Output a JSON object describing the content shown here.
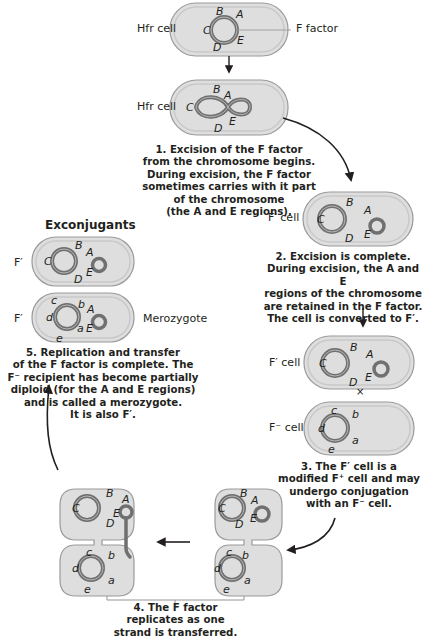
{
  "colors": {
    "cell_fill": "#dedede",
    "cell_membrane": "#c9c9c9",
    "cell_outline": "#9a9a9a",
    "chromosome": "#707070",
    "chromosome_inner": "#b5b5b5",
    "arrow": "#231f20",
    "text": "#231f20"
  },
  "labels": {
    "hfr_cell_1": "Hfr cell",
    "f_factor": "F factor",
    "hfr_cell_2": "Hfr cell",
    "f_prime_cell_2": "F′ cell",
    "f_prime_cell_3": "F′ cell",
    "cross": "×",
    "f_minus_cell": "F⁻ cell",
    "exconjugants": "Exconjugants",
    "exconjugant_1": "F′",
    "exconjugant_2": "F′",
    "merozygote": "Merozygote"
  },
  "genes": {
    "donor": [
      "A",
      "B",
      "C",
      "D",
      "E"
    ],
    "recipient": [
      "a",
      "b",
      "c",
      "d",
      "e"
    ]
  },
  "steps": [
    {
      "number": "1.",
      "lines": [
        "1. Excision of the F factor",
        "from the chromosome begins.",
        "During excision, the F factor",
        "sometimes carries with it part",
        "of the chromosome",
        "(the A and E regions)."
      ]
    },
    {
      "number": "2.",
      "lines": [
        "2. Excision is complete.",
        "During excision, the A and E",
        "regions of the chromosome",
        "are retained in the F factor.",
        "The cell is converted to F′."
      ]
    },
    {
      "number": "3.",
      "lines": [
        "3. The F′ cell is a",
        "modified F⁺ cell and may",
        "undergo conjugation",
        "with an F⁻ cell."
      ]
    },
    {
      "number": "4.",
      "lines": [
        "4. The F factor",
        "replicates as one",
        "strand is transferred."
      ]
    },
    {
      "number": "5.",
      "lines": [
        "5. Replication and transfer",
        "of the F factor is complete. The",
        "F⁻ recipient has become partially",
        "diploid (for the A and E regions)",
        "and is called a merozygote.",
        "It is also F′."
      ]
    }
  ]
}
